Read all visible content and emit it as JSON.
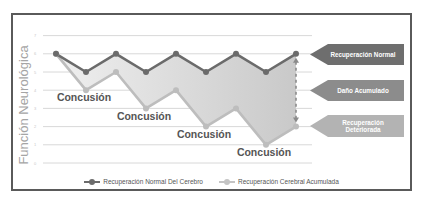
{
  "chart_data": {
    "type": "line",
    "title": "",
    "xlabel": "",
    "ylabel": "Función Neurológica",
    "ylim": [
      0,
      7
    ],
    "yticks": [
      0,
      1,
      2,
      3,
      4,
      5,
      6,
      7
    ],
    "grid": true,
    "legend_position": "bottom",
    "x": [
      1,
      2,
      3,
      4,
      5,
      6,
      7,
      8,
      9
    ],
    "series": [
      {
        "name": "Recuperación Normal Del Cerebro",
        "color": "#6b6b6b",
        "values": [
          6,
          5,
          6,
          5,
          6,
          5,
          6,
          5,
          6
        ]
      },
      {
        "name": "Recuperación Cerebral Acumulada",
        "color": "#bdbdbd",
        "values": [
          6,
          4,
          5,
          3,
          4,
          2,
          3,
          1,
          2
        ]
      }
    ],
    "annotations": [
      {
        "text": "Concusión",
        "x": 2,
        "y": 3.5
      },
      {
        "text": "Concusión",
        "x": 4,
        "y": 2.5
      },
      {
        "text": "Concusión",
        "x": 6,
        "y": 1.5
      },
      {
        "text": "Concusión",
        "x": 8,
        "y": 0.5
      }
    ],
    "callouts": [
      {
        "text": "Recuperación Normal",
        "color": "#6e6e6e"
      },
      {
        "text": "Daño Acumulado",
        "color": "#8c8c8c"
      },
      {
        "text": "Recuperación Deteriorada",
        "color": "#b3b3b3"
      }
    ]
  },
  "ui": {
    "ylabel": "Función Neurológica",
    "legend": {
      "normal": "Recuperación Normal Del Cerebro",
      "accum": "Recuperación Cerebral Acumulada"
    }
  }
}
